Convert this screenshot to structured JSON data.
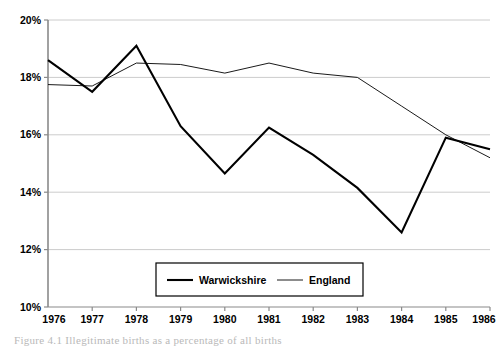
{
  "figure": {
    "background_color": "#ffffff",
    "caption": "Figure 4.1 Illegitimate births as a percentage of all births"
  },
  "chart_data": {
    "type": "line",
    "title": "",
    "subtitle": "",
    "xlabel": "",
    "ylabel": "",
    "x": [
      1976,
      1977,
      1978,
      1979,
      1980,
      1981,
      1982,
      1983,
      1984,
      1985,
      1986
    ],
    "categories": [
      "1976",
      "1977",
      "1978",
      "1979",
      "1980",
      "1981",
      "1982",
      "1983",
      "1984",
      "1985",
      "1986"
    ],
    "series": [
      {
        "name": "Warwickshire",
        "color": "#000000",
        "line_width": 2.1,
        "values": [
          18.6,
          17.5,
          19.1,
          16.3,
          14.65,
          16.25,
          15.3,
          14.15,
          12.6,
          15.9,
          15.5
        ]
      },
      {
        "name": "England",
        "color": "#000000",
        "line_width": 0.9,
        "values": [
          17.75,
          17.7,
          18.5,
          18.45,
          18.15,
          18.5,
          18.15,
          18.0,
          17.0,
          16.0,
          15.2
        ]
      }
    ],
    "ylim": [
      10,
      20
    ],
    "xlim": [
      1976,
      1986
    ],
    "yticks": [
      10,
      12,
      14,
      16,
      18,
      20
    ],
    "ytick_labels": [
      "10%",
      "12%",
      "14%",
      "16%",
      "18%",
      "20%"
    ],
    "xtick_labels": [
      "1976",
      "1977",
      "1978",
      "1979",
      "1980",
      "1981",
      "1982",
      "1983",
      "1984",
      "1985",
      "1986"
    ],
    "grid": {
      "horizontal": true,
      "vertical": false,
      "color": "#cccccc"
    },
    "legend": {
      "position": "bottom-center",
      "border": true,
      "entries": [
        {
          "label": "Warwickshire",
          "line_width": 2.1,
          "color": "#000000"
        },
        {
          "label": "England",
          "line_width": 0.9,
          "color": "#000000"
        }
      ]
    },
    "axis": {
      "left_spine": true,
      "bottom_spine": true,
      "top_spine": false,
      "right_spine": false,
      "color": "#808080"
    }
  }
}
